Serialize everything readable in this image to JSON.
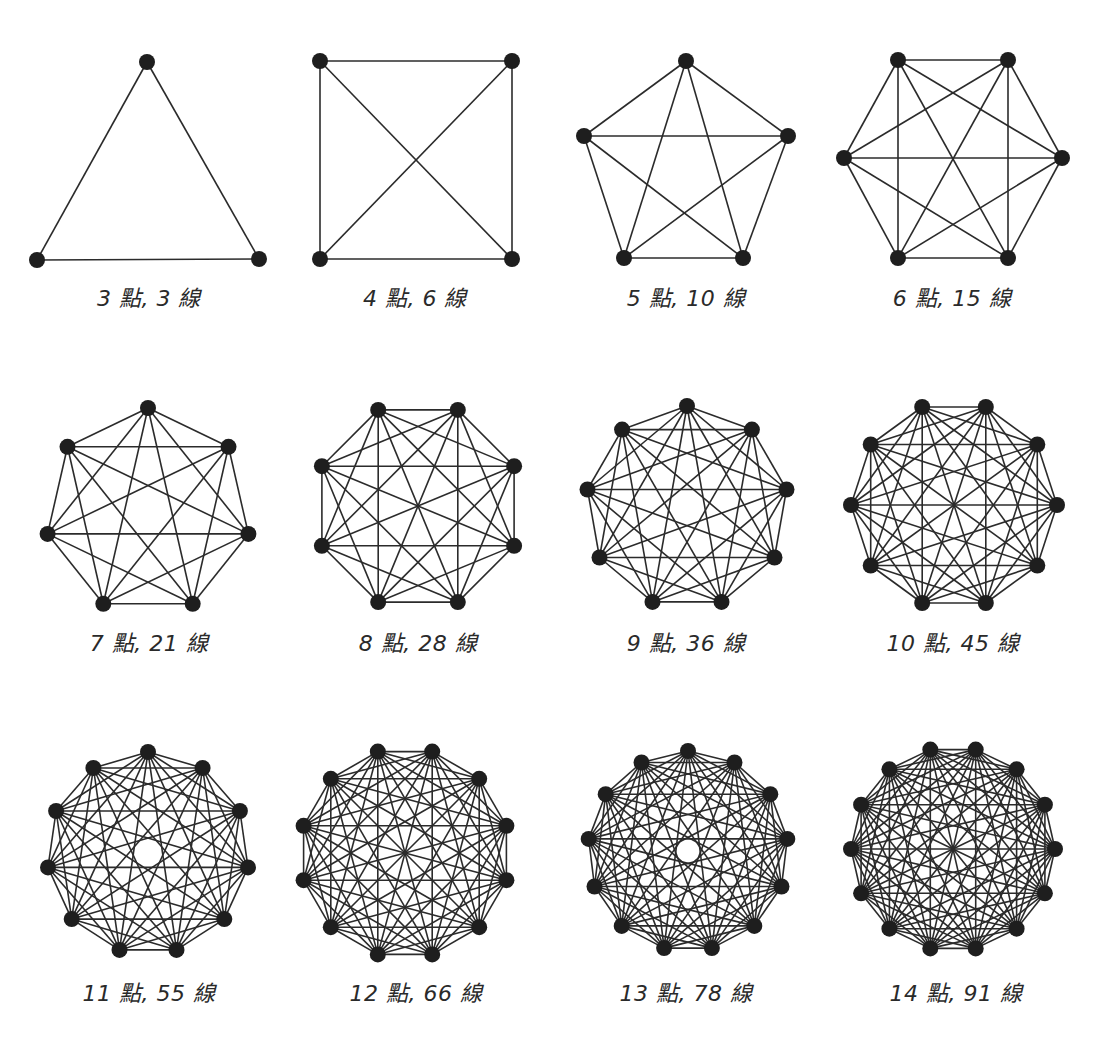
{
  "style": {
    "edge_color": "#2b2b2b",
    "node_color": "#1e1e1e",
    "background": "#ffffff",
    "label_color": "#2a2a2a"
  },
  "units": {
    "points": "點",
    "lines": "線"
  },
  "graphs": [
    {
      "points": 3,
      "lines": 3,
      "label": "3 點, 3 線",
      "cx": 148,
      "cy": 194,
      "r": 130,
      "rot": -90,
      "labelX": 149,
      "labelY": 280,
      "custom": [
        [
          147,
          62
        ],
        [
          259,
          259
        ],
        [
          37,
          260
        ]
      ]
    },
    {
      "points": 4,
      "lines": 6,
      "label": "4 點, 6 線",
      "cx": 416,
      "cy": 160,
      "r": 140,
      "rot": -135,
      "labelX": 415,
      "labelY": 280,
      "custom": [
        [
          320,
          61
        ],
        [
          512,
          61
        ],
        [
          512,
          259
        ],
        [
          320,
          259
        ]
      ]
    },
    {
      "points": 5,
      "lines": 10,
      "label": "5 點, 10 線",
      "cx": 686,
      "cy": 170,
      "r": 105,
      "rot": -90,
      "labelX": 686,
      "labelY": 280,
      "custom": [
        [
          686,
          61
        ],
        [
          788,
          136
        ],
        [
          743,
          258
        ],
        [
          624,
          258
        ],
        [
          584,
          136
        ]
      ]
    },
    {
      "points": 6,
      "lines": 15,
      "label": "6 點, 15 線",
      "cx": 953,
      "cy": 159,
      "r": 110,
      "rot": -120,
      "labelX": 952,
      "labelY": 280,
      "custom": [
        [
          898,
          60
        ],
        [
          1008,
          60
        ],
        [
          1062,
          158
        ],
        [
          1008,
          258
        ],
        [
          898,
          258
        ],
        [
          844,
          158
        ]
      ]
    },
    {
      "points": 7,
      "lines": 21,
      "label": "7 點, 21 線",
      "cx": 148,
      "cy": 511,
      "r": 103,
      "rot": -90,
      "labelX": 149,
      "labelY": 625
    },
    {
      "points": 8,
      "lines": 28,
      "label": "8 點, 28 線",
      "cx": 418,
      "cy": 506,
      "r": 104,
      "rot": -112.5,
      "labelX": 418,
      "labelY": 625
    },
    {
      "points": 9,
      "lines": 36,
      "label": "9 點, 36 線",
      "cx": 687,
      "cy": 507,
      "r": 101,
      "rot": -90,
      "labelX": 686,
      "labelY": 625
    },
    {
      "points": 10,
      "lines": 45,
      "label": "10 點, 45 線",
      "cx": 954,
      "cy": 505,
      "r": 103,
      "rot": -108,
      "labelX": 953,
      "labelY": 625
    },
    {
      "points": 11,
      "lines": 55,
      "label": "11 點, 55 線",
      "cx": 148,
      "cy": 853,
      "r": 101,
      "rot": -90,
      "labelX": 149,
      "labelY": 975
    },
    {
      "points": 12,
      "lines": 66,
      "label": "12 點, 66 線",
      "cx": 405,
      "cy": 853,
      "r": 105,
      "rot": -105,
      "labelX": 416,
      "labelY": 975
    },
    {
      "points": 13,
      "lines": 78,
      "label": "13 點, 78 線",
      "cx": 688,
      "cy": 851,
      "r": 100,
      "rot": -90,
      "labelX": 686,
      "labelY": 975
    },
    {
      "points": 14,
      "lines": 91,
      "label": "14 點, 91 線",
      "cx": 953,
      "cy": 849,
      "r": 102,
      "rot": -102.86,
      "labelX": 956,
      "labelY": 975
    }
  ]
}
